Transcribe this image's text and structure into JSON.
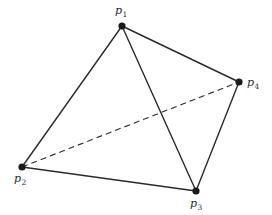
{
  "diagram": {
    "type": "complete-graph-K4",
    "points": [
      {
        "id": "p1",
        "name": "p",
        "sub": "1",
        "x": 122,
        "y": 26,
        "label_x": 115,
        "label_y": 14
      },
      {
        "id": "p2",
        "name": "p",
        "sub": "2",
        "x": 22,
        "y": 167,
        "label_x": 14,
        "label_y": 182
      },
      {
        "id": "p3",
        "name": "p",
        "sub": "3",
        "x": 196,
        "y": 191,
        "label_x": 190,
        "label_y": 207
      },
      {
        "id": "p4",
        "name": "p",
        "sub": "4",
        "x": 239,
        "y": 82,
        "label_x": 247,
        "label_y": 86
      }
    ],
    "edges": [
      {
        "from": "p1",
        "to": "p2",
        "style": "solid"
      },
      {
        "from": "p1",
        "to": "p3",
        "style": "solid"
      },
      {
        "from": "p1",
        "to": "p4",
        "style": "solid"
      },
      {
        "from": "p2",
        "to": "p3",
        "style": "solid"
      },
      {
        "from": "p3",
        "to": "p4",
        "style": "solid"
      },
      {
        "from": "p2",
        "to": "p4",
        "style": "dashed"
      }
    ],
    "colors": {
      "line": "#2a2a2a",
      "vertex": "#1a1a1a",
      "background": "#ffffff"
    }
  }
}
